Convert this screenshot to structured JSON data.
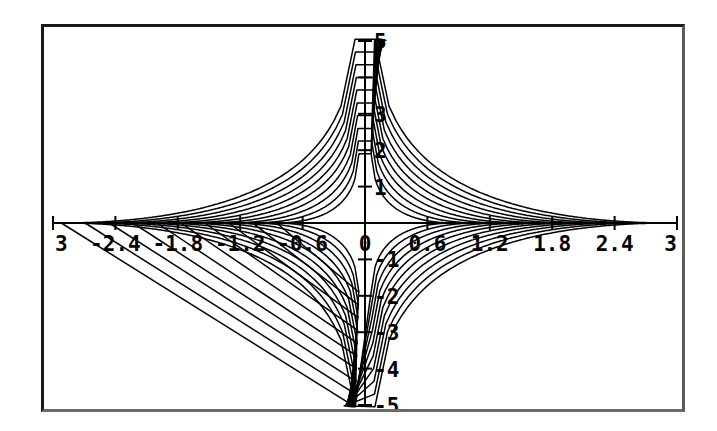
{
  "figure": {
    "title": "",
    "background_color": "#ffffff",
    "frame_color": "#1a1a1a",
    "curve_color": "#000000"
  },
  "chart_data": {
    "type": "line",
    "title": "",
    "subtitle": "",
    "xlabel": "",
    "ylabel": "",
    "grid": false,
    "legend": null,
    "xlim": [
      -3,
      3
    ],
    "ylim": [
      -5,
      5
    ],
    "xticks": [
      -3,
      -2.4,
      -1.8,
      -1.2,
      -0.6,
      0,
      0.6,
      1.2,
      1.8,
      2.4,
      3
    ],
    "xtick_labels": [
      "3",
      "-2.4",
      "-1.8",
      "-1.2",
      "-0.6",
      "0",
      "0.6",
      "1.2",
      "1.8",
      "2.4",
      "3"
    ],
    "yticks": [
      -5,
      -4,
      -3,
      -2,
      -1,
      0,
      1,
      2,
      3,
      4,
      5
    ],
    "ytick_labels": [
      "-5",
      "-4",
      "-3",
      "-2",
      "",
      "-1",
      "",
      "1",
      "2",
      "3",
      "",
      "5"
    ],
    "ytick_visible_labels": [
      "5",
      "3",
      "2",
      "1",
      "-1",
      "-2",
      "-3",
      "-4",
      "-5"
    ],
    "n_curves": 10,
    "series": [
      {
        "name": "level-1",
        "c": 0.55,
        "values": []
      },
      {
        "name": "level-2",
        "c": 0.7,
        "values": []
      },
      {
        "name": "level-3",
        "c": 0.85,
        "values": []
      },
      {
        "name": "level-4",
        "c": 1.0,
        "values": []
      },
      {
        "name": "level-5",
        "c": 1.15,
        "values": []
      },
      {
        "name": "level-6",
        "c": 1.3,
        "values": []
      },
      {
        "name": "level-7",
        "c": 1.45,
        "values": []
      },
      {
        "name": "level-8",
        "c": 1.6,
        "values": []
      },
      {
        "name": "level-9",
        "c": 1.75,
        "values": []
      },
      {
        "name": "level-10",
        "c": 1.9,
        "values": []
      }
    ]
  },
  "axes": {
    "x_axis_name": "x-axis",
    "y_axis_name": "y-axis",
    "x_tick_labels": [
      {
        "value": -3,
        "text": "3"
      },
      {
        "value": -2.4,
        "text": "-2.4"
      },
      {
        "value": -1.8,
        "text": "-1.8"
      },
      {
        "value": -1.2,
        "text": "-1.2"
      },
      {
        "value": -0.6,
        "text": "-0.6"
      },
      {
        "value": 0,
        "text": "0"
      },
      {
        "value": 0.6,
        "text": "0.6"
      },
      {
        "value": 1.2,
        "text": "1.2"
      },
      {
        "value": 1.8,
        "text": "1.8"
      },
      {
        "value": 2.4,
        "text": "2.4"
      },
      {
        "value": 3,
        "text": "3"
      }
    ],
    "y_tick_labels": [
      {
        "value": 5,
        "text": "5"
      },
      {
        "value": 3,
        "text": "3"
      },
      {
        "value": 2,
        "text": "2"
      },
      {
        "value": 1,
        "text": "1"
      },
      {
        "value": -1,
        "text": "-1"
      },
      {
        "value": -2,
        "text": "-2"
      },
      {
        "value": -3,
        "text": "-3"
      },
      {
        "value": -4,
        "text": "-4"
      },
      {
        "value": -5,
        "text": "-5"
      }
    ]
  }
}
